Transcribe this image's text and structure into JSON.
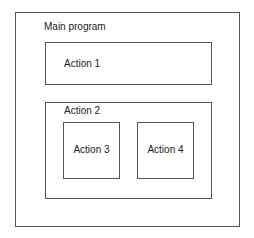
{
  "diagram": {
    "main": {
      "label": "Main program"
    },
    "action1": {
      "label": "Action 1"
    },
    "action2": {
      "label": "Action 2",
      "children": [
        {
          "label": "Action 3"
        },
        {
          "label": "Action 4"
        }
      ]
    }
  }
}
